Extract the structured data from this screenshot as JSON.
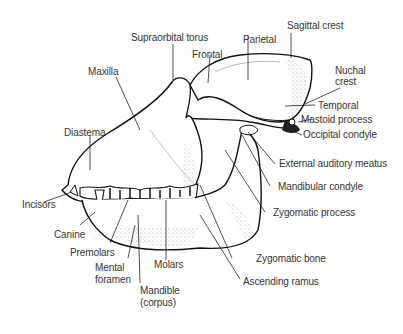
{
  "figure": {
    "labels": {
      "sagittal_crest": "Sagittal crest",
      "supraorbital_torus": "Supraorbital torus",
      "parietal": "Parietal",
      "frontal": "Frontal",
      "maxilla": "Maxilla",
      "nuchal_crest_1": "Nuchal",
      "nuchal_crest_2": "crest",
      "temporal": "Temporal",
      "mastoid_process": "Mastoid process",
      "occipital_condyle": "Occipital condyle",
      "diastema": "Diastema",
      "external_auditory_meatus": "External auditory meatus",
      "mandibular_condyle": "Mandibular condyle",
      "zygomatic_process": "Zygomatic process",
      "incisors": "Incisors",
      "canine": "Canine",
      "zygomatic_bone": "Zygomatic bone",
      "premolars": "Premolars",
      "mental_foramen_1": "Mental",
      "mental_foramen_2": "foramen",
      "molars": "Molars",
      "ascending_ramus": "Ascending ramus",
      "mandible_1": "Mandible",
      "mandible_2": "(corpus)"
    }
  }
}
